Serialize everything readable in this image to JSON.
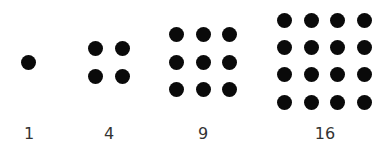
{
  "colors": {
    "dot": "#0a0a0a",
    "label": "#333333",
    "background": "#ffffff"
  },
  "groups": [
    {
      "label": "1",
      "n": 1,
      "cols": [
        28
      ],
      "rows": [
        62
      ]
    },
    {
      "label": "4",
      "n": 2,
      "cols": [
        95,
        122
      ],
      "rows": [
        48,
        76
      ]
    },
    {
      "label": "9",
      "n": 3,
      "cols": [
        176,
        203,
        229
      ],
      "rows": [
        34,
        62,
        89
      ]
    },
    {
      "label": "16",
      "n": 4,
      "cols": [
        284,
        311,
        337,
        364
      ],
      "rows": [
        20,
        47,
        74,
        102
      ]
    }
  ],
  "label_x": [
    29,
    109,
    203,
    325
  ]
}
